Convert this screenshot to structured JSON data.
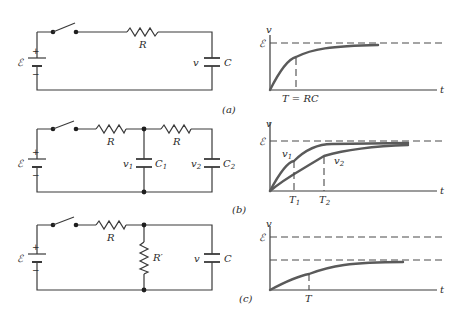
{
  "panels": [
    {
      "id": "a",
      "caption": "(a)",
      "circuit": {
        "source": "ℰ",
        "plus": "+",
        "minus": "−",
        "resistor": "R",
        "cap_voltage": "v",
        "capacitor": "C"
      },
      "graph": {
        "y_axis": "v",
        "x_axis": "t",
        "asymptote": "ℰ",
        "time_marker": "T = RC"
      }
    },
    {
      "id": "b",
      "caption": "(b)",
      "circuit": {
        "source": "ℰ",
        "plus": "+",
        "minus": "−",
        "resistor1": "R",
        "resistor2": "R",
        "v1": "v",
        "v1_sub": "1",
        "c1": "C",
        "c1_sub": "1",
        "v2": "v",
        "v2_sub": "2",
        "c2": "C",
        "c2_sub": "2"
      },
      "graph": {
        "y_axis": "v",
        "x_axis": "t",
        "asymptote": "ℰ",
        "curve1": "v",
        "curve1_sub": "1",
        "curve2": "v",
        "curve2_sub": "2",
        "t1": "T",
        "t1_sub": "1",
        "t2": "T",
        "t2_sub": "2"
      }
    },
    {
      "id": "c",
      "caption": "(c)",
      "circuit": {
        "source": "ℰ",
        "plus": "+",
        "minus": "−",
        "resistor": "R",
        "shunt": "R′",
        "cap_voltage": "v",
        "capacitor": "C"
      },
      "graph": {
        "y_axis": "v",
        "x_axis": "t",
        "asymptote": "ℰ",
        "time_marker": "T"
      }
    }
  ]
}
